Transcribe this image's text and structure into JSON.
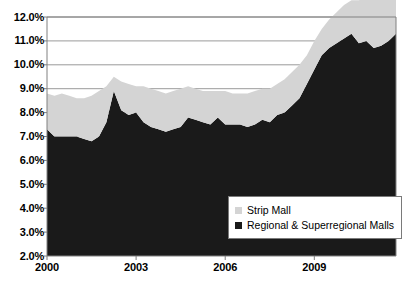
{
  "chart_data": {
    "type": "area",
    "stacked": true,
    "title": "",
    "subtitle": "",
    "xlabel": "",
    "ylabel": "",
    "ylim": [
      2.0,
      12.0
    ],
    "ytick_step": 1.0,
    "ytick_labels": [
      "12.0%",
      "11.0%",
      "10.0%",
      "9.0%",
      "8.0%",
      "7.0%",
      "6.0%",
      "5.0%",
      "4.0%",
      "3.0%",
      "2.0%"
    ],
    "ytick_values": [
      12.0,
      11.0,
      10.0,
      9.0,
      8.0,
      7.0,
      6.0,
      5.0,
      4.0,
      3.0,
      2.0
    ],
    "xtick_labels": [
      "2000",
      "2003",
      "2006",
      "2009"
    ],
    "xtick_values": [
      2000,
      2003,
      2006,
      2009
    ],
    "xlim": [
      2000,
      2011.75
    ],
    "grid": "horizontal",
    "legend_position": "inside-bottom-right",
    "legend": [
      {
        "name": "Strip Mall",
        "color": "#d4d4d4"
      },
      {
        "name": "Regional & Superregional Malls",
        "color": "#1a1a1a"
      }
    ],
    "x": [
      2000.0,
      2000.25,
      2000.5,
      2000.75,
      2001.0,
      2001.25,
      2001.5,
      2001.75,
      2002.0,
      2002.25,
      2002.5,
      2002.75,
      2003.0,
      2003.25,
      2003.5,
      2003.75,
      2004.0,
      2004.25,
      2004.5,
      2004.75,
      2005.0,
      2005.25,
      2005.5,
      2005.75,
      2006.0,
      2006.25,
      2006.5,
      2006.75,
      2007.0,
      2007.25,
      2007.5,
      2007.75,
      2008.0,
      2008.25,
      2008.5,
      2008.75,
      2009.0,
      2009.25,
      2009.5,
      2009.75,
      2010.0,
      2010.25,
      2010.5,
      2010.75,
      2011.0,
      2011.25,
      2011.5,
      2011.75
    ],
    "series": [
      {
        "name": "Regional & Superregional Malls",
        "color": "#1a1a1a",
        "values": [
          5.3,
          5.0,
          5.0,
          5.0,
          5.0,
          4.9,
          4.8,
          5.0,
          5.6,
          6.9,
          6.1,
          5.9,
          6.0,
          5.6,
          5.4,
          5.3,
          5.2,
          5.3,
          5.4,
          5.8,
          5.7,
          5.6,
          5.5,
          5.8,
          5.5,
          5.5,
          5.5,
          5.4,
          5.5,
          5.7,
          5.6,
          5.9,
          6.0,
          6.3,
          6.6,
          7.2,
          7.8,
          8.4,
          8.7,
          8.9,
          9.1,
          9.3,
          8.9,
          9.0,
          8.7,
          8.8,
          9.0,
          9.3
        ]
      },
      {
        "name": "Strip Mall",
        "color": "#d4d4d4",
        "values": [
          1.5,
          1.7,
          1.8,
          1.7,
          1.6,
          1.7,
          1.9,
          1.9,
          1.5,
          0.6,
          1.2,
          1.3,
          1.1,
          1.5,
          1.6,
          1.6,
          1.6,
          1.6,
          1.6,
          1.3,
          1.3,
          1.3,
          1.4,
          1.1,
          1.4,
          1.3,
          1.3,
          1.4,
          1.4,
          1.3,
          1.4,
          1.3,
          1.4,
          1.4,
          1.4,
          1.2,
          1.2,
          1.1,
          1.2,
          1.3,
          1.4,
          1.4,
          1.8,
          1.8,
          2.1,
          2.1,
          1.9,
          1.6
        ]
      }
    ],
    "axis_color": "#808080",
    "grid_color": "#808080",
    "background": "#ffffff"
  },
  "layout": {
    "plot_left": 47,
    "plot_right": 396,
    "plot_top": 17,
    "plot_bottom": 256
  }
}
